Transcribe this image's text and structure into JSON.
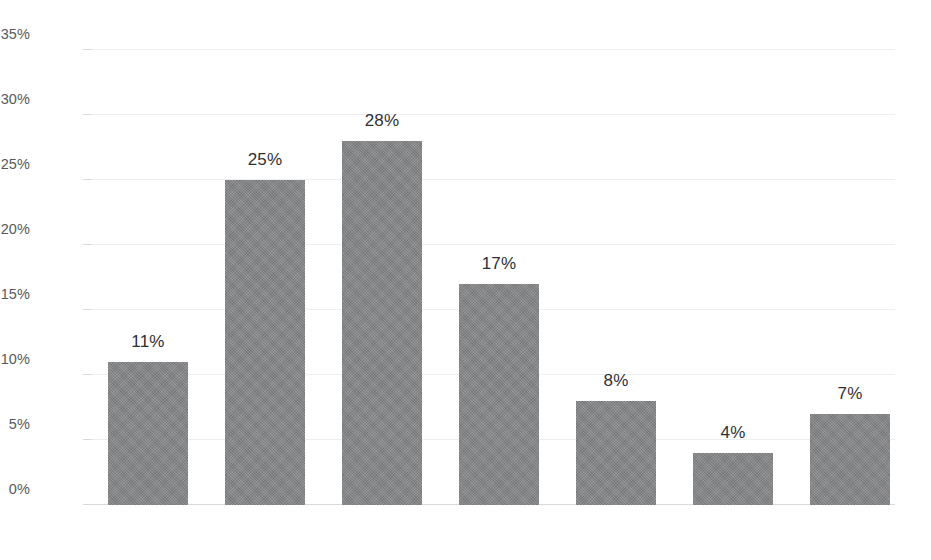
{
  "chart_data": {
    "type": "bar",
    "title": "",
    "subtitle": "",
    "xlabel": "",
    "ylabel": "",
    "categories": [
      "$0–$149",
      "$150–$299",
      "$300–$449",
      "$450–$599",
      "$600–$749",
      "$750–$899",
      "$900+"
    ],
    "values": [
      11,
      25,
      28,
      17,
      8,
      4,
      7
    ],
    "value_labels": [
      "11%",
      "25%",
      "28%",
      "17%",
      "8%",
      "4%",
      "7%"
    ],
    "ylim": [
      0,
      35
    ],
    "y_ticks": [
      0,
      5,
      10,
      15,
      20,
      25,
      30,
      35
    ],
    "y_tick_labels": [
      "0%",
      "5%",
      "10%",
      "15%",
      "20%",
      "25%",
      "30%",
      "35%"
    ],
    "grid": true,
    "legend": "none",
    "colors": {
      "bar": "#828385",
      "gridline": "#eceef0",
      "axis_line": "#d8dadc",
      "tick_label": "#58595b",
      "value_label": "#2f3033",
      "background": "#ffffff"
    }
  }
}
